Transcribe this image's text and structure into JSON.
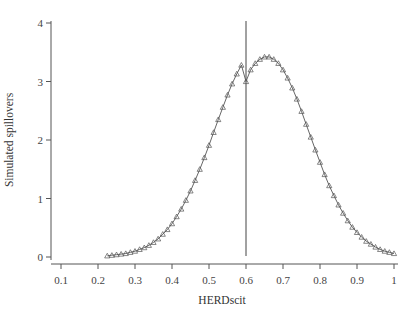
{
  "chart_data": {
    "type": "line",
    "title": "",
    "xlabel": "HERDscit",
    "ylabel": "Simulated spillovers",
    "xlim": [
      0.1,
      1.0
    ],
    "ylim": [
      0,
      4
    ],
    "grid": false,
    "legend": null,
    "x_ticks": [
      0.1,
      0.2,
      0.3,
      0.4,
      0.5,
      0.6,
      0.7,
      0.8,
      0.9,
      1.0
    ],
    "x_tick_labels": [
      "0.1",
      "0.2",
      "0.3",
      "0.4",
      "0.5",
      "0.6",
      "0.7",
      "0.8",
      "0.9",
      "1"
    ],
    "y_ticks": [
      0,
      1,
      2,
      3,
      4
    ],
    "y_tick_labels": [
      "0",
      "1",
      "2",
      "3",
      "4"
    ],
    "reference_lines": [
      {
        "orientation": "vertical",
        "x": 0.6
      }
    ],
    "series": [
      {
        "name": "Simulated spillovers",
        "marker": "triangle-open",
        "x": [
          0.225,
          0.2375,
          0.25,
          0.2625,
          0.275,
          0.2875,
          0.3,
          0.3125,
          0.325,
          0.3375,
          0.35,
          0.3625,
          0.375,
          0.3875,
          0.4,
          0.4125,
          0.425,
          0.4375,
          0.45,
          0.4625,
          0.475,
          0.4875,
          0.5,
          0.5125,
          0.525,
          0.5375,
          0.55,
          0.5625,
          0.575,
          0.5875,
          0.6,
          0.6125,
          0.625,
          0.6375,
          0.65,
          0.6625,
          0.675,
          0.6875,
          0.7,
          0.7125,
          0.725,
          0.7375,
          0.75,
          0.7625,
          0.775,
          0.7875,
          0.8,
          0.8125,
          0.825,
          0.8375,
          0.85,
          0.8625,
          0.875,
          0.8875,
          0.9,
          0.9125,
          0.925,
          0.9375,
          0.95,
          0.9625,
          0.975,
          0.9875,
          1.0
        ],
        "values": [
          0.02,
          0.03,
          0.04,
          0.05,
          0.06,
          0.08,
          0.1,
          0.13,
          0.16,
          0.2,
          0.25,
          0.31,
          0.39,
          0.47,
          0.57,
          0.69,
          0.82,
          0.97,
          1.13,
          1.31,
          1.5,
          1.7,
          1.91,
          2.13,
          2.35,
          2.56,
          2.77,
          2.96,
          3.13,
          3.28,
          3.0,
          3.2,
          3.31,
          3.38,
          3.42,
          3.42,
          3.38,
          3.31,
          3.2,
          3.06,
          2.89,
          2.7,
          2.49,
          2.27,
          2.05,
          1.83,
          1.62,
          1.41,
          1.22,
          1.05,
          0.89,
          0.75,
          0.62,
          0.51,
          0.42,
          0.34,
          0.27,
          0.22,
          0.17,
          0.13,
          0.1,
          0.08,
          0.06
        ]
      }
    ]
  }
}
